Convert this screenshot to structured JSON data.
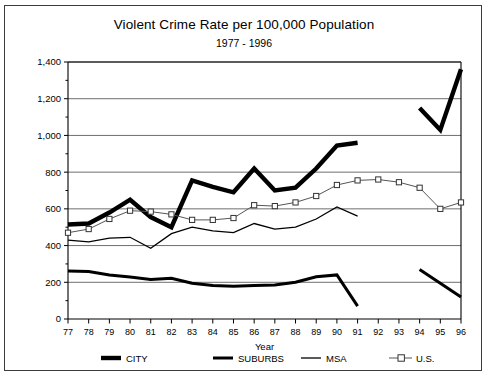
{
  "chart_data": {
    "type": "line",
    "title": "Violent Crime Rate per 100,000 Population",
    "subtitle": "1977 - 1996",
    "xlabel": "Year",
    "ylabel": "",
    "grid": true,
    "legend_position": "bottom",
    "xlim": [
      77,
      96
    ],
    "ylim": [
      0,
      1400
    ],
    "ytick_step": 200,
    "yminor_step": 100,
    "categories": [
      "77",
      "78",
      "79",
      "80",
      "81",
      "82",
      "83",
      "84",
      "85",
      "86",
      "87",
      "88",
      "89",
      "90",
      "91",
      "92",
      "93",
      "94",
      "95",
      "96"
    ],
    "ytick_labels": [
      "0",
      "200",
      "400",
      "600",
      "800",
      "1,000",
      "1,200",
      "1,400"
    ],
    "series": [
      {
        "name": "CITY",
        "style": "thick-solid",
        "values": [
          515,
          520,
          580,
          650,
          555,
          500,
          755,
          720,
          690,
          820,
          700,
          715,
          820,
          945,
          960,
          null,
          null,
          1150,
          1030,
          1360
        ]
      },
      {
        "name": "SUBURBS",
        "style": "medium-solid",
        "values": [
          262,
          258,
          240,
          228,
          215,
          222,
          195,
          182,
          178,
          183,
          185,
          200,
          230,
          240,
          70,
          null,
          null,
          270,
          195,
          120
        ]
      },
      {
        "name": "MSA",
        "style": "thin-solid",
        "values": [
          430,
          420,
          440,
          445,
          385,
          465,
          500,
          480,
          470,
          520,
          490,
          500,
          545,
          610,
          560,
          null,
          null,
          null,
          null,
          null
        ]
      },
      {
        "name": "U.S.",
        "style": "thin-marker-square",
        "values": [
          470,
          490,
          545,
          590,
          585,
          570,
          540,
          540,
          550,
          620,
          615,
          635,
          670,
          730,
          755,
          760,
          745,
          715,
          600,
          635
        ]
      }
    ]
  },
  "legend": {
    "items": [
      {
        "label": "CITY",
        "marker": "thick-line"
      },
      {
        "label": "SUBURBS",
        "marker": "medium-line"
      },
      {
        "label": "MSA",
        "marker": "thin-line"
      },
      {
        "label": "U.S.",
        "marker": "thin-line-square"
      }
    ]
  },
  "footnote": ""
}
